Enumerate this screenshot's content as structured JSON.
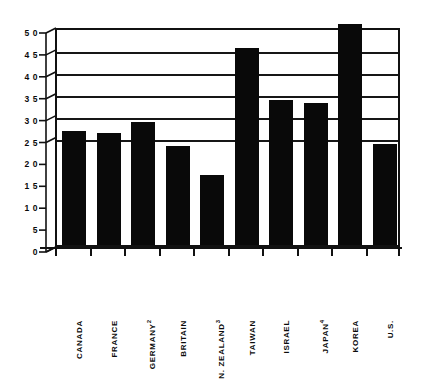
{
  "chart_data": {
    "type": "bar",
    "title": "",
    "subtitle": "",
    "xlabel": "",
    "ylabel": "",
    "categories": [
      "CANADA",
      "FRANCE",
      "GERMANY",
      "BRITAIN",
      "N. ZEALAND",
      "TAIWAN",
      "ISRAEL",
      "JAPAN",
      "KOREA",
      "U.S."
    ],
    "category_footnotes": [
      "",
      "",
      "2",
      "",
      "3",
      "",
      "",
      "4",
      "",
      ""
    ],
    "values": [
      2.6,
      2.55,
      2.8,
      2.25,
      1.6,
      4.5,
      3.3,
      3.25,
      5.05,
      2.3
    ],
    "ylim": [
      0,
      5.0
    ],
    "ytick_values": [
      0,
      0.5,
      1.0,
      1.5,
      2.0,
      2.5,
      3.0,
      3.5,
      4.0,
      4.5,
      5.0
    ],
    "ytick_labels": [
      "0",
      "5",
      "1 0",
      "1 5",
      "2 0",
      "2 5",
      "3 0",
      "3 5",
      "4 0",
      "4 5",
      "5 0"
    ],
    "gridlines_at": [
      2.5,
      3.0,
      3.5,
      4.0,
      4.5,
      5.0
    ],
    "grid": true,
    "legend": "none",
    "bar_color": "#090909",
    "axis_color": "#111111",
    "background_color": "#ffffff"
  },
  "figure": {
    "style_note": "scanned monochrome bar chart with 3D offset axis"
  }
}
